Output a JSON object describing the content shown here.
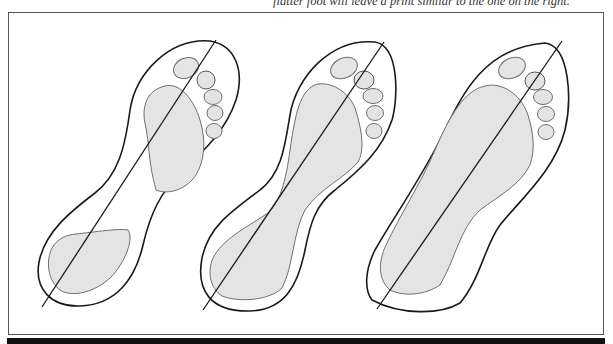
{
  "caption": {
    "left_fragment": "",
    "right_fragment": "flatter foot will leave a print similar to the one on the right."
  },
  "figure": {
    "footprints": [
      {
        "id": "high-arch",
        "label": "High arch: separate forefoot and heel contact patches"
      },
      {
        "id": "normal-arch",
        "label": "Normal arch: narrow connected midfoot band"
      },
      {
        "id": "flat-foot",
        "label": "Flat foot: broad full-length contact area"
      }
    ],
    "colors": {
      "outline": "#1a1a1a",
      "contact_fill": "#e4e4e4",
      "contact_stroke": "#6e6e6e",
      "frame": "#555555",
      "bar": "#111111"
    }
  }
}
